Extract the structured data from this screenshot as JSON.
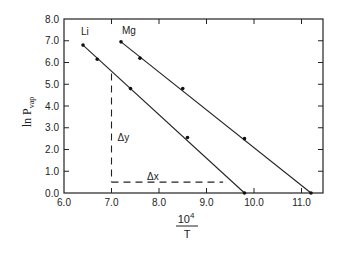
{
  "chart_data": {
    "type": "scatter",
    "title": "",
    "xlabel": "10^4 / T",
    "xlabel_numerator": "10",
    "xlabel_exponent": "4",
    "xlabel_denominator": "T",
    "ylabel": "ln P_vap",
    "ylabel_main": "ln P",
    "ylabel_sub": "vap",
    "xlim": [
      6.0,
      11.45
    ],
    "ylim": [
      0.0,
      8.0
    ],
    "x_ticks": [
      "6.0",
      "7.0",
      "8.0",
      "9.0",
      "10.0",
      "11.0"
    ],
    "y_ticks": [
      "0.0",
      "1.0",
      "2.0",
      "3.0",
      "4.0",
      "5.0",
      "6.0",
      "7.0",
      "8.0"
    ],
    "grid": false,
    "series": [
      {
        "name": "Li",
        "points": [
          [
            6.4,
            6.8
          ],
          [
            6.7,
            6.15
          ],
          [
            7.4,
            4.8
          ],
          [
            8.6,
            2.55
          ],
          [
            9.8,
            0.0
          ]
        ],
        "fit_line": [
          [
            6.4,
            6.8
          ],
          [
            9.8,
            0.0
          ]
        ]
      },
      {
        "name": "Mg",
        "points": [
          [
            7.2,
            6.95
          ],
          [
            7.6,
            6.2
          ],
          [
            8.5,
            4.8
          ],
          [
            9.8,
            2.5
          ],
          [
            11.2,
            0.0
          ]
        ],
        "fit_line": [
          [
            7.2,
            6.95
          ],
          [
            11.2,
            0.0
          ]
        ]
      }
    ],
    "annotations": [
      {
        "text": "Δy",
        "type": "dashed-vertical",
        "x": 7.0,
        "y_from": 5.5,
        "y_to": 0.5
      },
      {
        "text": "Δx",
        "type": "dashed-horizontal",
        "y": 0.5,
        "x_from": 7.0,
        "x_to": 9.35
      }
    ]
  }
}
